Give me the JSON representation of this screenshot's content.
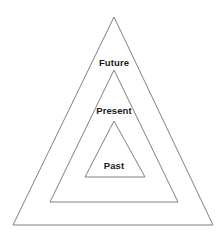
{
  "canvas": {
    "width": 223,
    "height": 238,
    "background_color": "#ffffff"
  },
  "diagram": {
    "title_fragment": "",
    "type": "nested-pyramid",
    "stroke_color": "#808080",
    "stroke_width": 1,
    "fill_color": "none",
    "label_color": "#1a1a1a",
    "layers": [
      {
        "id": "outer",
        "label": "Future",
        "apex": {
          "x": 114,
          "y": 17
        },
        "base_left": {
          "x": 13,
          "y": 225
        },
        "base_right": {
          "x": 213,
          "y": 225
        },
        "label_position": {
          "x": 114,
          "y": 62
        }
      },
      {
        "id": "middle",
        "label": "Present",
        "apex": {
          "x": 114,
          "y": 70
        },
        "base_left": {
          "x": 50,
          "y": 202
        },
        "base_right": {
          "x": 178,
          "y": 202
        },
        "label_position": {
          "x": 114,
          "y": 110
        }
      },
      {
        "id": "inner",
        "label": "Past",
        "apex": {
          "x": 114,
          "y": 121
        },
        "base_left": {
          "x": 85,
          "y": 177
        },
        "base_right": {
          "x": 145,
          "y": 177
        },
        "label_position": {
          "x": 114,
          "y": 165
        }
      }
    ]
  }
}
